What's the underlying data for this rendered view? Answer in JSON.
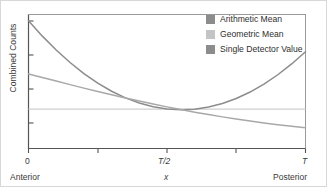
{
  "figure": {
    "title": "",
    "background": "#ffffff",
    "border_color": "#d8d8d8"
  },
  "axes": {
    "ylabel": "Combined Counts",
    "xlabel": "x",
    "frame_color": "#555555",
    "x_tick_labels": [
      "0",
      "T/2",
      "T"
    ],
    "x_sub_labels": [
      "Anterior",
      "Posterior"
    ],
    "left_sub_label": "Anterior",
    "right_sub_label": "Posterior",
    "tick_0": "0",
    "tick_half": "T/2",
    "tick_full": "T"
  },
  "legend": {
    "position": "top-right",
    "items": [
      {
        "label": "Arithmetic Mean",
        "color": "#8c8c8c"
      },
      {
        "label": "Geometric Mean",
        "color": "#c4c4c4"
      },
      {
        "label": "Single Detector Value",
        "color": "#8c8c8c"
      }
    ]
  },
  "chart_data": {
    "type": "line",
    "title": "",
    "xlabel": "x",
    "ylabel": "Combined Counts",
    "xlim": [
      0,
      1
    ],
    "ylim": [
      0,
      1
    ],
    "grid": false,
    "legend_position": "top-right",
    "x_tick_values": [
      0,
      0.25,
      0.5,
      0.75,
      1
    ],
    "x_tick_labels": [
      "0",
      "",
      "T/2",
      "",
      "T"
    ],
    "x_axis_endpoint_labels": [
      "Anterior",
      "Posterior"
    ],
    "y_tick_values": [
      0.22,
      0.47,
      0.72,
      0.95
    ],
    "y_tick_labels": [
      "",
      "",
      "",
      ""
    ],
    "annotations": [
      "Anterior",
      "x",
      "Posterior"
    ],
    "x": [
      0,
      0.05,
      0.1,
      0.15,
      0.2,
      0.25,
      0.3,
      0.35,
      0.4,
      0.45,
      0.5,
      0.55,
      0.6,
      0.65,
      0.7,
      0.75,
      0.8,
      0.85,
      0.9,
      0.95,
      1
    ],
    "series": [
      {
        "name": "Arithmetic Mean",
        "color": "#8c8c8c",
        "values": [
          0.95,
          0.836,
          0.733,
          0.641,
          0.559,
          0.488,
          0.428,
          0.379,
          0.341,
          0.313,
          0.296,
          0.29,
          0.295,
          0.311,
          0.337,
          0.374,
          0.422,
          0.481,
          0.55,
          0.63,
          0.72
        ]
      },
      {
        "name": "Geometric Mean",
        "color": "#a8a8a8",
        "values": [
          0.555,
          0.529,
          0.503,
          0.477,
          0.451,
          0.426,
          0.402,
          0.378,
          0.355,
          0.333,
          0.312,
          0.292,
          0.273,
          0.255,
          0.238,
          0.222,
          0.207,
          0.193,
          0.18,
          0.168,
          0.157
        ]
      },
      {
        "name": "Single Detector Value",
        "color": "#cfcfcf",
        "values": [
          0.295,
          0.295,
          0.295,
          0.295,
          0.295,
          0.295,
          0.295,
          0.295,
          0.295,
          0.295,
          0.295,
          0.295,
          0.295,
          0.295,
          0.295,
          0.295,
          0.295,
          0.295,
          0.295,
          0.295,
          0.295
        ]
      }
    ]
  }
}
